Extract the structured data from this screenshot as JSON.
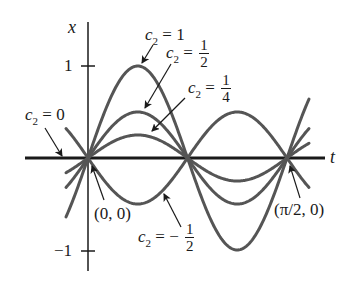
{
  "diagram": {
    "type": "family-of-solution-curves",
    "function": "x = c2 sin(4t)",
    "axes": {
      "horizontal_label": "t",
      "vertical_label": "x",
      "y_ticks": [
        {
          "value": 1,
          "label": "1"
        },
        {
          "value": -1,
          "label": "−1"
        }
      ]
    },
    "colors": {
      "axis": "#1a1a1a",
      "curve": "#555555",
      "text": "#1a1a1a",
      "arrow": "#1a1a1a"
    },
    "curves": [
      {
        "c2": 1,
        "label_var": "c",
        "label_sub": "2",
        "label_eq": "=",
        "label_value": "1"
      },
      {
        "c2": 0.5,
        "label_var": "c",
        "label_sub": "2",
        "label_eq": "=",
        "label_num": "1",
        "label_den": "2"
      },
      {
        "c2": 0.25,
        "label_var": "c",
        "label_sub": "2",
        "label_eq": "=",
        "label_num": "1",
        "label_den": "4"
      },
      {
        "c2": 0,
        "label_var": "c",
        "label_sub": "2",
        "label_eq": "=",
        "label_value": "0"
      },
      {
        "c2": -0.5,
        "label_var": "c",
        "label_sub": "2",
        "label_eq": "= −",
        "label_num": "1",
        "label_den": "2"
      }
    ],
    "points": [
      {
        "label": "(0, 0)"
      },
      {
        "label": "(π/2, 0)"
      }
    ]
  }
}
